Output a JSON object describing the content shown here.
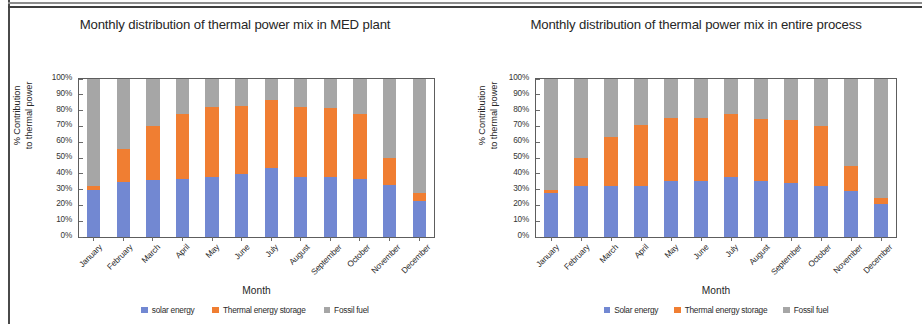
{
  "colors": {
    "solar": "#7288d2",
    "storage": "#f07e32",
    "fossil": "#a6a6a6",
    "axis": "#5d5d5d",
    "text": "#262626"
  },
  "charts": [
    {
      "id": "med-plant",
      "title": "Monthly distribution of thermal power mix in MED plant",
      "ylabel_line1": "% Contribution",
      "ylabel_line2": "to thermal power",
      "xlabel": "Month",
      "ytick_labels": [
        "100%",
        "90%",
        "80%",
        "70%",
        "60%",
        "50%",
        "40%",
        "30%",
        "20%",
        "10%",
        "0%"
      ],
      "legend": [
        {
          "label": "solar energy",
          "color": "#7288d2"
        },
        {
          "label": "Thermal energy storage",
          "color": "#f07e32"
        },
        {
          "label": "Fossil fuel",
          "color": "#a6a6a6"
        }
      ],
      "chart_data": {
        "type": "bar",
        "stacked": true,
        "title": "Monthly distribution of thermal power mix in MED plant",
        "xlabel": "Month",
        "ylabel": "% Contribution to thermal power",
        "ylim": [
          0,
          100
        ],
        "ytick_values": [
          0,
          10,
          20,
          30,
          40,
          50,
          60,
          70,
          80,
          90,
          100
        ],
        "grid": false,
        "legend_position": "bottom",
        "categories": [
          "January",
          "February",
          "March",
          "April",
          "May",
          "June",
          "July",
          "August",
          "September",
          "October",
          "November",
          "December"
        ],
        "series": [
          {
            "name": "solar energy",
            "color": "#7288d2",
            "values": [
              30,
              35,
              36,
              36.5,
              38,
              40,
              43.5,
              38,
              38,
              36.5,
              33,
              23
            ]
          },
          {
            "name": "Thermal energy storage",
            "color": "#f07e32",
            "values": [
              2,
              21,
              34,
              41.5,
              44,
              43,
              43,
              44,
              43.5,
              41.5,
              17,
              5
            ]
          },
          {
            "name": "Fossil fuel",
            "color": "#a6a6a6",
            "values": [
              68,
              44,
              30,
              22,
              18,
              17,
              13.5,
              18,
              18.5,
              22,
              50,
              72
            ]
          }
        ],
        "cumulative_tops": {
          "solar": [
            30,
            35,
            36,
            36.5,
            38,
            40,
            43.5,
            38,
            38,
            36.5,
            33,
            23
          ],
          "storage": [
            32,
            56,
            70,
            78,
            82,
            83,
            86.5,
            82,
            81.5,
            78,
            50,
            28
          ]
        }
      }
    },
    {
      "id": "entire-process",
      "title": "Monthly distribution of thermal power mix in entire process",
      "ylabel_line1": "% Contribution",
      "ylabel_line2": "to thermal power",
      "xlabel": "Month",
      "ytick_labels": [
        "100%",
        "90%",
        "80%",
        "70%",
        "60%",
        "50%",
        "40%",
        "30%",
        "20%",
        "10%",
        "0%"
      ],
      "legend": [
        {
          "label": "Solar energy",
          "color": "#7288d2"
        },
        {
          "label": "Thermal energy storage",
          "color": "#f07e32"
        },
        {
          "label": "Fossil fuel",
          "color": "#a6a6a6"
        }
      ],
      "chart_data": {
        "type": "bar",
        "stacked": true,
        "title": "Monthly distribution of thermal power mix in entire process",
        "xlabel": "Month",
        "ylabel": "% Contribution to thermal power",
        "ylim": [
          0,
          100
        ],
        "ytick_values": [
          0,
          10,
          20,
          30,
          40,
          50,
          60,
          70,
          80,
          90,
          100
        ],
        "grid": false,
        "legend_position": "bottom",
        "categories": [
          "January",
          "February",
          "March",
          "April",
          "May",
          "June",
          "July",
          "August",
          "September",
          "October",
          "November",
          "December"
        ],
        "series": [
          {
            "name": "Solar energy",
            "color": "#7288d2",
            "values": [
              28,
              32,
              32,
              32,
              35.5,
              35.5,
              38,
              35.5,
              34,
              32,
              29,
              21
            ]
          },
          {
            "name": "Thermal energy storage",
            "color": "#f07e32",
            "values": [
              2,
              18,
              31,
              39,
              40,
              40,
              40,
              39.5,
              40,
              38.5,
              16,
              4
            ]
          },
          {
            "name": "Fossil fuel",
            "color": "#a6a6a6",
            "values": [
              70,
              50,
              37,
              29,
              24.5,
              24.5,
              22,
              25,
              26,
              29.5,
              55,
              75
            ]
          }
        ],
        "cumulative_tops": {
          "solar": [
            28,
            32,
            32,
            32,
            35.5,
            35.5,
            38,
            35.5,
            34,
            32,
            29,
            21
          ],
          "storage": [
            30,
            50,
            63,
            71,
            75.5,
            75.5,
            78,
            75,
            74,
            70.5,
            45,
            25
          ]
        }
      }
    }
  ]
}
